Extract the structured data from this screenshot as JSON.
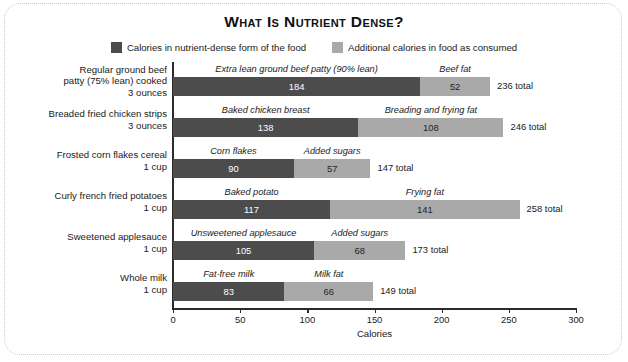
{
  "figure": {
    "title": "What Is Nutrient Dense?",
    "frame_style": "dotted-rounded"
  },
  "legend": {
    "position": "top-center",
    "items": [
      {
        "label": "Calories in nutrient-dense form of the food",
        "color": "#4c4c4c",
        "swatch_name": "legend-swatch-dark"
      },
      {
        "label": "Additional calories in food as consumed",
        "color": "#a9a9a9",
        "swatch_name": "legend-swatch-light"
      }
    ]
  },
  "axis": {
    "xlabel": "Calories",
    "ticks": [
      "0",
      "50",
      "100",
      "150",
      "200",
      "250",
      "300"
    ],
    "xlim": [
      0,
      300
    ]
  },
  "chart_data": {
    "type": "bar",
    "orientation": "horizontal",
    "stacked": true,
    "title": "What Is Nutrient Dense?",
    "xlabel": "Calories",
    "ylabel": "",
    "xlim": [
      0,
      300
    ],
    "xticks": [
      0,
      50,
      100,
      150,
      200,
      250,
      300
    ],
    "grid": false,
    "legend": [
      "Calories in nutrient-dense form of the food",
      "Additional calories in food as consumed"
    ],
    "categories": [
      "Regular ground beef patty (75% lean) cooked 3 ounces",
      "Breaded fried chicken strips 3 ounces",
      "Frosted corn flakes cereal 1 cup",
      "Curly french fried potatoes 1 cup",
      "Sweetened applesauce 1 cup",
      "Whole milk 1 cup"
    ],
    "series": [
      {
        "name": "Calories in nutrient-dense form of the food",
        "values": [
          184,
          138,
          90,
          117,
          105,
          83
        ]
      },
      {
        "name": "Additional calories in food as consumed",
        "values": [
          52,
          108,
          57,
          141,
          68,
          66
        ]
      }
    ],
    "totals": [
      236,
      246,
      147,
      258,
      173,
      149
    ]
  },
  "rows": [
    {
      "category_label": "Regular ground beef\npatty (75% lean) cooked\n3 ounces",
      "dark": {
        "caption": "Extra lean ground beef patty (90% lean)",
        "value": "184"
      },
      "light": {
        "caption": "Beef fat",
        "value": "52"
      },
      "total": "236 total"
    },
    {
      "category_label": "Breaded fried chicken strips\n3 ounces",
      "dark": {
        "caption": "Baked chicken breast",
        "value": "138"
      },
      "light": {
        "caption": "Breading and frying fat",
        "value": "108"
      },
      "total": "246 total"
    },
    {
      "category_label": "Frosted corn flakes cereal\n1 cup",
      "dark": {
        "caption": "Corn flakes",
        "value": "90"
      },
      "light": {
        "caption": "Added sugars",
        "value": "57"
      },
      "total": "147 total"
    },
    {
      "category_label": "Curly french fried potatoes\n1 cup",
      "dark": {
        "caption": "Baked potato",
        "value": "117"
      },
      "light": {
        "caption": "Frying fat",
        "value": "141"
      },
      "total": "258 total"
    },
    {
      "category_label": "Sweetened applesauce\n1 cup",
      "dark": {
        "caption": "Unsweetened applesauce",
        "value": "105"
      },
      "light": {
        "caption": "Added sugars",
        "value": "68"
      },
      "total": "173 total"
    },
    {
      "category_label": "Whole milk\n1 cup",
      "dark": {
        "caption": "Fat-free milk",
        "value": "83"
      },
      "light": {
        "caption": "Milk fat",
        "value": "66"
      },
      "total": "149 total"
    }
  ]
}
